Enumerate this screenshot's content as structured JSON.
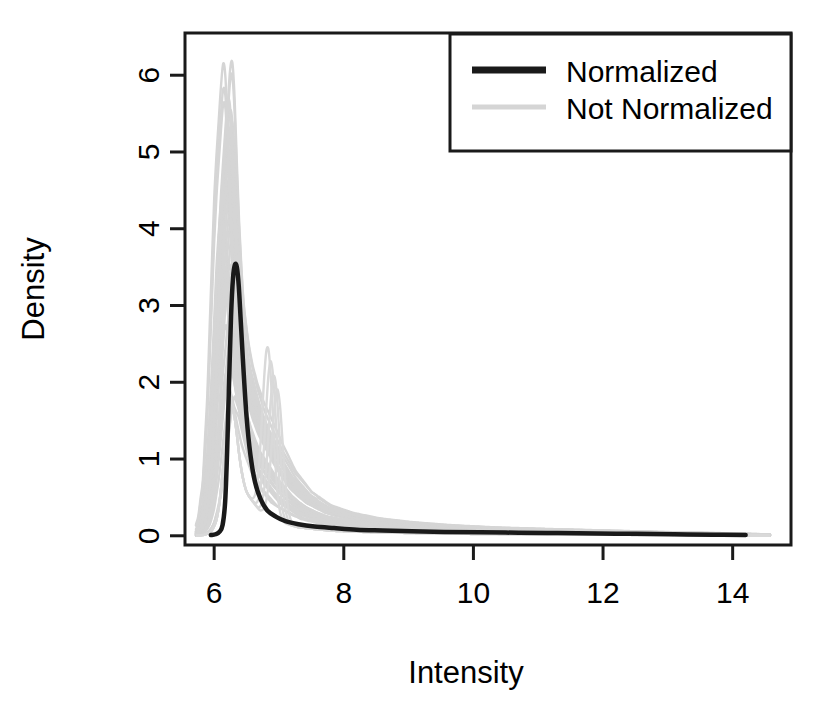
{
  "chart_data": {
    "type": "line",
    "title": "",
    "subtitle": "",
    "xlabel": "Intensity",
    "ylabel": "Density",
    "xlim": [
      5.55,
      14.9
    ],
    "ylim": [
      -0.12,
      6.55
    ],
    "xticks": [
      6,
      8,
      10,
      12,
      14
    ],
    "xtick_labels": [
      "6",
      "8",
      "10",
      "12",
      "14"
    ],
    "yticks": [
      0,
      1,
      2,
      3,
      4,
      5,
      6
    ],
    "ytick_labels": [
      "0",
      "1",
      "2",
      "3",
      "4",
      "5",
      "6"
    ],
    "grid": false,
    "legend_position": "top-right",
    "legend_entries": [
      {
        "label": "Normalized",
        "color": "#1a1a1a",
        "linewidth": 4.5
      },
      {
        "label": "Not Normalized",
        "color": "#d5d5d5",
        "linewidth": 3
      }
    ],
    "series": [
      {
        "name": "Normalized",
        "color": "#1a1a1a",
        "linewidth": 4.5,
        "x": [
          5.95,
          6.02,
          6.08,
          6.13,
          6.17,
          6.2,
          6.23,
          6.26,
          6.29,
          6.32,
          6.35,
          6.38,
          6.41,
          6.45,
          6.5,
          6.56,
          6.63,
          6.72,
          6.82,
          6.95,
          7.1,
          7.3,
          7.55,
          7.85,
          8.2,
          8.6,
          9.05,
          9.55,
          10.1,
          10.7,
          11.3,
          11.9,
          12.5,
          13.1,
          13.7,
          14.2
        ],
        "y": [
          0.01,
          0.02,
          0.05,
          0.14,
          0.45,
          1.1,
          2.0,
          2.85,
          3.35,
          3.53,
          3.5,
          3.25,
          2.8,
          2.2,
          1.55,
          1.05,
          0.7,
          0.47,
          0.33,
          0.25,
          0.19,
          0.15,
          0.12,
          0.1,
          0.08,
          0.07,
          0.06,
          0.05,
          0.045,
          0.04,
          0.035,
          0.03,
          0.025,
          0.02,
          0.015,
          0.01
        ]
      },
      {
        "name": "Not Normalized",
        "color": "#d5d5d5",
        "linewidth": 2.4,
        "curve_count": 36,
        "band_description": "Overlaid unnormalized density curves forming a grey envelope; tallest peaks reach about 6.3 near intensity 6.2, with a secondary mode near intensity 6.9 reaching about 2.2.",
        "envelope_upper": {
          "x": [
            5.72,
            5.82,
            5.9,
            5.97,
            6.03,
            6.08,
            6.12,
            6.16,
            6.19,
            6.22,
            6.25,
            6.28,
            6.31,
            6.35,
            6.4,
            6.46,
            6.53,
            6.62,
            6.72,
            6.85,
            7.0,
            7.2,
            7.45,
            7.75,
            8.1,
            8.5,
            9.0,
            9.6,
            10.3,
            11.1,
            12.0,
            12.9,
            13.8,
            14.5
          ],
          "y": [
            0.03,
            0.2,
            0.75,
            1.9,
            3.4,
            4.6,
            5.2,
            5.7,
            6.1,
            6.3,
            6.05,
            5.4,
            4.6,
            3.8,
            3.1,
            2.65,
            2.3,
            2.0,
            1.75,
            1.5,
            1.2,
            0.85,
            0.58,
            0.4,
            0.3,
            0.23,
            0.18,
            0.14,
            0.11,
            0.09,
            0.07,
            0.05,
            0.035,
            0.02
          ]
        },
        "envelope_lower": {
          "x": [
            5.72,
            5.85,
            5.95,
            6.05,
            6.15,
            6.25,
            6.35,
            6.5,
            6.7,
            6.95,
            7.3,
            7.8,
            8.5,
            9.5,
            11.0,
            12.5,
            14.5
          ],
          "y": [
            0.0,
            0.02,
            0.08,
            0.3,
            0.9,
            1.6,
            1.5,
            1.0,
            0.6,
            0.35,
            0.2,
            0.12,
            0.08,
            0.05,
            0.03,
            0.02,
            0.0
          ]
        },
        "secondary_mode": {
          "x": 6.9,
          "y": 2.2
        }
      }
    ]
  },
  "axes": {
    "x_label": "Intensity",
    "y_label": "Density",
    "box_color": "#1a1a1a"
  }
}
